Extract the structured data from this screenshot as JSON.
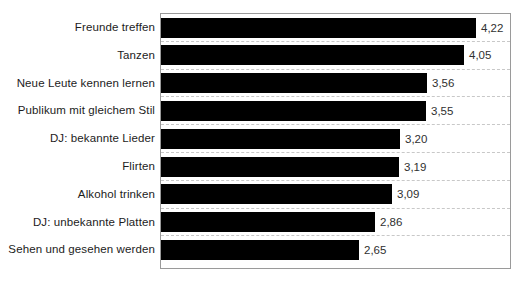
{
  "chart_data": {
    "type": "bar",
    "orientation": "horizontal",
    "title": "",
    "xlabel": "",
    "ylabel": "",
    "xlim": [
      0,
      4.67
    ],
    "grid": "horizontal-dashed",
    "legend": "none",
    "bar_color": "#000000",
    "categories": [
      "Freunde treffen",
      "Tanzen",
      "Neue Leute kennen lernen",
      "Publikum mit gleichem Stil",
      "DJ: bekannte Lieder",
      "Flirten",
      "Alkohol trinken",
      "DJ: unbekannte Platten",
      "Sehen und gesehen werden"
    ],
    "values": [
      4.22,
      4.05,
      3.56,
      3.55,
      3.2,
      3.19,
      3.09,
      2.86,
      2.65
    ],
    "value_labels": [
      "4,22",
      "4,05",
      "3,56",
      "3,55",
      "3,20",
      "3,19",
      "3,09",
      "2,86",
      "2,65"
    ]
  }
}
